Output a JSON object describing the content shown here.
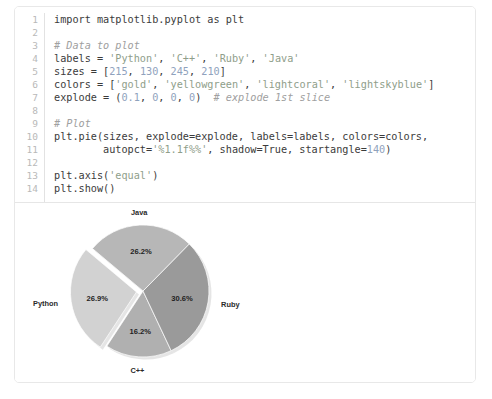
{
  "card": {
    "name": "code-and-output-card"
  },
  "code": {
    "language": "python",
    "line_numbers": [
      "1",
      "2",
      "3",
      "4",
      "5",
      "6",
      "7",
      "8",
      "9",
      "10",
      "11",
      "12",
      "13",
      "14"
    ],
    "lines": [
      {
        "n": "1",
        "segments": [
          {
            "t": "import matplotlib.pyplot as plt",
            "k": "plain"
          }
        ]
      },
      {
        "n": "2",
        "segments": [
          {
            "t": "",
            "k": "plain"
          }
        ]
      },
      {
        "n": "3",
        "segments": [
          {
            "t": "# Data to plot",
            "k": "com"
          }
        ]
      },
      {
        "n": "4",
        "segments": [
          {
            "t": "labels = ",
            "k": "plain"
          },
          {
            "t": "'Python'",
            "k": "str"
          },
          {
            "t": ", ",
            "k": "plain"
          },
          {
            "t": "'C++'",
            "k": "str"
          },
          {
            "t": ", ",
            "k": "plain"
          },
          {
            "t": "'Ruby'",
            "k": "str"
          },
          {
            "t": ", ",
            "k": "plain"
          },
          {
            "t": "'Java'",
            "k": "str"
          }
        ]
      },
      {
        "n": "5",
        "segments": [
          {
            "t": "sizes = [",
            "k": "plain"
          },
          {
            "t": "215",
            "k": "num"
          },
          {
            "t": ", ",
            "k": "plain"
          },
          {
            "t": "130",
            "k": "num"
          },
          {
            "t": ", ",
            "k": "plain"
          },
          {
            "t": "245",
            "k": "num"
          },
          {
            "t": ", ",
            "k": "plain"
          },
          {
            "t": "210",
            "k": "num"
          },
          {
            "t": "]",
            "k": "plain"
          }
        ]
      },
      {
        "n": "6",
        "segments": [
          {
            "t": "colors = [",
            "k": "plain"
          },
          {
            "t": "'gold'",
            "k": "str"
          },
          {
            "t": ", ",
            "k": "plain"
          },
          {
            "t": "'yellowgreen'",
            "k": "str"
          },
          {
            "t": ", ",
            "k": "plain"
          },
          {
            "t": "'lightcoral'",
            "k": "str"
          },
          {
            "t": ", ",
            "k": "plain"
          },
          {
            "t": "'lightskyblue'",
            "k": "str"
          },
          {
            "t": "]",
            "k": "plain"
          }
        ]
      },
      {
        "n": "7",
        "segments": [
          {
            "t": "explode = (",
            "k": "plain"
          },
          {
            "t": "0.1",
            "k": "num"
          },
          {
            "t": ", ",
            "k": "plain"
          },
          {
            "t": "0",
            "k": "num"
          },
          {
            "t": ", ",
            "k": "plain"
          },
          {
            "t": "0",
            "k": "num"
          },
          {
            "t": ", ",
            "k": "plain"
          },
          {
            "t": "0",
            "k": "num"
          },
          {
            "t": ")  ",
            "k": "plain"
          },
          {
            "t": "# explode 1st slice",
            "k": "com"
          }
        ]
      },
      {
        "n": "8",
        "segments": [
          {
            "t": "",
            "k": "plain"
          }
        ]
      },
      {
        "n": "9",
        "segments": [
          {
            "t": "# Plot",
            "k": "com"
          }
        ]
      },
      {
        "n": "10",
        "segments": [
          {
            "t": "plt.pie(sizes, explode=explode, labels=labels, colors=colors,",
            "k": "plain"
          }
        ]
      },
      {
        "n": "11",
        "segments": [
          {
            "t": "        autopct=",
            "k": "plain"
          },
          {
            "t": "'%1.1f%%'",
            "k": "str"
          },
          {
            "t": ", shadow=True, startangle=",
            "k": "plain"
          },
          {
            "t": "140",
            "k": "num"
          },
          {
            "t": ")",
            "k": "plain"
          }
        ]
      },
      {
        "n": "12",
        "segments": [
          {
            "t": "",
            "k": "plain"
          }
        ]
      },
      {
        "n": "13",
        "segments": [
          {
            "t": "plt.axis(",
            "k": "plain"
          },
          {
            "t": "'equal'",
            "k": "str"
          },
          {
            "t": ")",
            "k": "plain"
          }
        ]
      },
      {
        "n": "14",
        "segments": [
          {
            "t": "plt.show()",
            "k": "plain"
          }
        ]
      }
    ]
  },
  "chart_data": {
    "type": "pie",
    "title": "",
    "labels": [
      "Python",
      "C++",
      "Ruby",
      "Java"
    ],
    "sizes": [
      215,
      130,
      245,
      210
    ],
    "values_percent": [
      26.9,
      16.2,
      30.6,
      26.2
    ],
    "autopct_labels": [
      "26.9%",
      "16.2%",
      "30.6%",
      "26.2%"
    ],
    "explode": [
      0.1,
      0,
      0,
      0
    ],
    "startangle": 140,
    "shadow": true,
    "colors_source": [
      "gold",
      "yellowgreen",
      "lightcoral",
      "lightskyblue"
    ],
    "rendered_colors": [
      "#d2d2d2",
      "#b0b0b0",
      "#9a9a9a",
      "#b7b7b7"
    ],
    "legend": "none",
    "grid": false,
    "label_positions": {
      "Python": "left",
      "C++": "bottom",
      "Ruby": "right",
      "Java": "top"
    }
  }
}
